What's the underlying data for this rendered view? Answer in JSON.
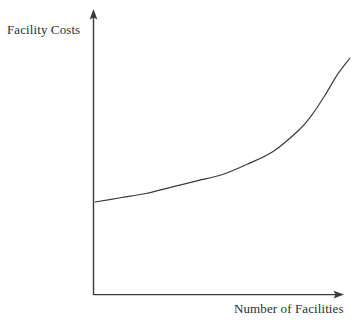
{
  "chart_data": {
    "type": "line",
    "title": "",
    "subtitle": "",
    "xlabel": "Number of Facilities",
    "ylabel": "Facility Costs",
    "grid": false,
    "legend": false,
    "legend_position": "none",
    "axis_style": "arrow-tipped open axes, no tick marks, no numeric scale",
    "xlim": [
      0,
      100
    ],
    "ylim": [
      0,
      100
    ],
    "xticks": [],
    "yticks": [],
    "xticklabels": [],
    "yticklabels": [],
    "annotations": [],
    "series": [
      {
        "name": "Facility Costs",
        "description": "Costs rise slowly at first, then increase sharply as the number of facilities grows (exponential J-curve).",
        "color": "#3a3a3a",
        "linewidth": 1,
        "x": [
          0,
          10,
          20,
          30,
          40,
          50,
          60,
          70,
          80,
          85,
          90,
          95,
          100
        ],
        "y": [
          32,
          34,
          36,
          39,
          42,
          45,
          50,
          56,
          66,
          73,
          82,
          92,
          100
        ]
      }
    ]
  },
  "chart": {
    "ylabel_text": "Facility Costs",
    "xlabel_text": "Number of Facilities",
    "colors": {
      "background": "#ffffff",
      "axis": "#3a3a3a",
      "curve": "#3a3a3a",
      "label_text": "#2e2e2e"
    }
  }
}
